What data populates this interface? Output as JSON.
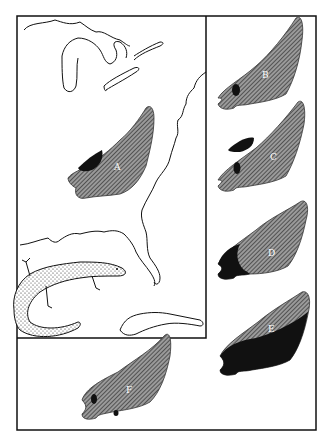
{
  "figure": {
    "map_label": "A",
    "panels": [
      {
        "id": "B",
        "label": "B",
        "dark_area": "small spot in west"
      },
      {
        "id": "C",
        "label": "C",
        "dark_area": "spot and northern patch"
      },
      {
        "id": "D",
        "label": "D",
        "dark_area": "western portion"
      },
      {
        "id": "E",
        "label": "E",
        "dark_area": "southern half"
      },
      {
        "id": "F",
        "label": "F",
        "dark_area": "two small spots"
      }
    ],
    "colors": {
      "ink": "#111111",
      "hatch": "#555555",
      "paper": "#ffffff"
    }
  }
}
